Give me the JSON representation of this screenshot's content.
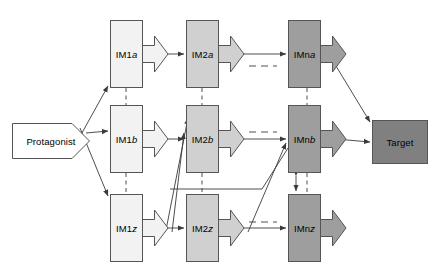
{
  "figure": {
    "width": 442,
    "height": 279,
    "background": "#ffffff"
  },
  "colors": {
    "protagonist_fill": "#ffffff",
    "col1_fill": "#f2f2f2",
    "col2_fill": "#d0d0d0",
    "col3_fill": "#9e9e9e",
    "target_fill": "#808080",
    "stroke": "#555555",
    "edge": "#3a3a3a",
    "text": "#000000"
  },
  "nodes": {
    "protagonist": {
      "label": "Protagonist",
      "x": 12,
      "y": 123,
      "w": 78,
      "h": 36
    },
    "target": {
      "label": "Target",
      "x": 372,
      "y": 120,
      "w": 56,
      "h": 44
    },
    "im_grid": [
      {
        "id": "im1a",
        "label_main": "IM1",
        "label_italic": "a",
        "x": 110,
        "y": 20,
        "w": 33,
        "h": 68,
        "col": 1,
        "row": "a"
      },
      {
        "id": "im2a",
        "label_main": "IM2",
        "label_italic": "a",
        "x": 186,
        "y": 20,
        "w": 33,
        "h": 68,
        "col": 2,
        "row": "a"
      },
      {
        "id": "imna",
        "label_main": "IMn",
        "label_italic": "a",
        "x": 288,
        "y": 20,
        "w": 33,
        "h": 68,
        "col": 3,
        "row": "a"
      },
      {
        "id": "im1b",
        "label_main": "IM1",
        "label_italic": "b",
        "x": 110,
        "y": 105,
        "w": 33,
        "h": 68,
        "col": 1,
        "row": "b"
      },
      {
        "id": "im2b",
        "label_main": "IM2",
        "label_italic": "b",
        "x": 186,
        "y": 105,
        "w": 33,
        "h": 68,
        "col": 2,
        "row": "b"
      },
      {
        "id": "imnb",
        "label_main": "IMn",
        "label_italic": "b",
        "x": 288,
        "y": 105,
        "w": 33,
        "h": 68,
        "col": 3,
        "row": "b"
      },
      {
        "id": "im1z",
        "label_main": "IM1",
        "label_italic": "z",
        "x": 110,
        "y": 194,
        "w": 33,
        "h": 68,
        "col": 1,
        "row": "z"
      },
      {
        "id": "im2z",
        "label_main": "IM2",
        "label_italic": "z",
        "x": 186,
        "y": 194,
        "w": 33,
        "h": 68,
        "col": 2,
        "row": "z"
      },
      {
        "id": "imnz",
        "label_main": "IMn",
        "label_italic": "z",
        "x": 288,
        "y": 194,
        "w": 33,
        "h": 68,
        "col": 3,
        "row": "z"
      }
    ]
  },
  "edges": {
    "note": "thin solid arrows between stages; dashed horizontal runs denote omitted intermediate stages; dashed vertical runs denote omitted rows",
    "solid_arrow_count": 12,
    "dashed_horizontal_count": 3,
    "dashed_vertical_count": 6,
    "double_headed_count": 1
  }
}
